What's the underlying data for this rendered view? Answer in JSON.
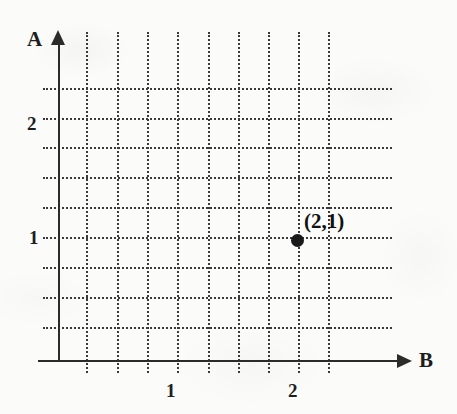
{
  "figure": {
    "kind": "coordinate-plane-sketch",
    "background_color": "#fbfbfa",
    "ink_color": "#2b2b2b"
  },
  "axes": {
    "x_axis_name": "B",
    "y_axis_name": "A",
    "x_tick_labels": [
      "1",
      "2"
    ],
    "y_tick_labels": [
      "2",
      "1"
    ]
  },
  "annotations": {
    "point_label": "(2,1)"
  },
  "chart_data": {
    "type": "scatter",
    "title": "",
    "xlabel": "B",
    "ylabel": "A",
    "xlim": [
      0,
      2.95
    ],
    "ylim": [
      0,
      2.7
    ],
    "grid": true,
    "grid_spacing_x": 0.25,
    "grid_spacing_y": 0.25,
    "xticks": [
      1,
      2
    ],
    "xticklabels": [
      "1",
      "2"
    ],
    "yticks": [
      1,
      2
    ],
    "yticklabels": [
      "1",
      "2"
    ],
    "legend": "none",
    "points": [
      {
        "x": 2,
        "y": 1,
        "label": "(2,1)",
        "marker": "filled-circle"
      }
    ],
    "series": [
      {
        "name": "point",
        "x": [
          2
        ],
        "y": [
          1
        ]
      }
    ]
  },
  "geometry": {
    "vertical_gridlines_x": [
      86,
      117,
      147,
      177,
      208,
      238,
      268,
      298,
      328
    ],
    "horizontal_gridlines_y": [
      88,
      118,
      147,
      177,
      207,
      237,
      267,
      297,
      327
    ],
    "gridline_v_top": 32,
    "gridline_v_bottom": 373,
    "gridline_h_left": 43,
    "gridline_h_right": 392,
    "y_axis_x": 58,
    "y_axis_top": 44,
    "y_axis_bottom": 362,
    "x_axis_y": 360,
    "x_axis_left": 38,
    "x_axis_right": 399,
    "arrow_up": {
      "x": 51,
      "y": 30
    },
    "arrow_right": {
      "x": 397,
      "y": 354
    },
    "label_A": {
      "x": 27,
      "y": 29
    },
    "label_B": {
      "x": 419,
      "y": 350
    },
    "label_y2": {
      "x": 27,
      "y": 114
    },
    "label_y1": {
      "x": 29,
      "y": 228
    },
    "label_x1": {
      "x": 166,
      "y": 381
    },
    "label_x2": {
      "x": 288,
      "y": 381
    },
    "point": {
      "x": 291,
      "y": 234
    },
    "point_label": {
      "x": 304,
      "y": 211
    }
  }
}
